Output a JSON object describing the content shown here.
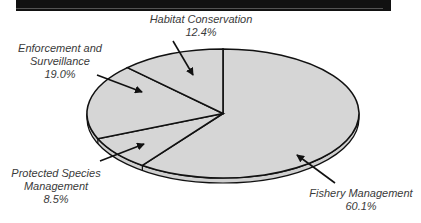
{
  "chart_data": {
    "type": "pie",
    "title": "",
    "style": "3d-ellipse",
    "categories": [
      "Fishery Management",
      "Protected Species Management",
      "Enforcement and Surveillance",
      "Habitat Conservation"
    ],
    "values": [
      60.1,
      8.5,
      19.0,
      12.4
    ],
    "unit": "%",
    "fill_color": "#d6d6d6",
    "outline_color": "#111111",
    "start_angle": "12 o'clock",
    "direction": "clockwise",
    "labels": [
      {
        "lines": [
          "Fishery Management"
        ],
        "value": "60.1%"
      },
      {
        "lines": [
          "Protected Species",
          "Management"
        ],
        "value": "8.5%"
      },
      {
        "lines": [
          "Enforcement and",
          "Surveillance"
        ],
        "value": "19.0%"
      },
      {
        "lines": [
          "Habitat Conservation"
        ],
        "value": "12.4%"
      }
    ]
  }
}
